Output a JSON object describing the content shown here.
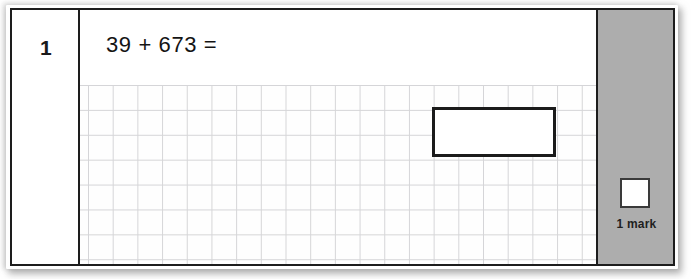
{
  "document": {
    "type": "maths-test-question",
    "question_number": "1",
    "expression": "39 + 673 =",
    "answer_value": "",
    "colors": {
      "frame_border": "#1d1d1d",
      "grid_line": "#c9c9cc",
      "mark_panel_background": "#adadad",
      "answer_box_border": "#1b1b1b",
      "text": "#141414",
      "page_background": "#ffffff"
    }
  },
  "number_column": {
    "label": "1"
  },
  "work_area": {
    "statement": "39 + 673 =",
    "answer_box": {
      "value": "",
      "placeholder": ""
    },
    "grid": {
      "visible": true,
      "cell_size_px": 25
    }
  },
  "mark_column": {
    "tick_box_value": "",
    "mark_label": "1 mark"
  }
}
